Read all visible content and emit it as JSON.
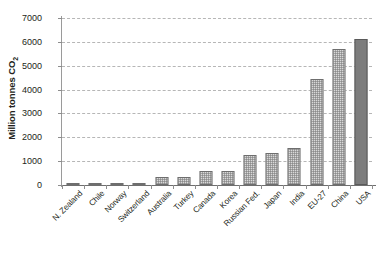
{
  "chart_data": {
    "type": "bar",
    "title": "",
    "subtitle": "",
    "xlabel": "",
    "ylabel": "Million tonnes CO2",
    "ylabel_display": "Million tonnes CO",
    "ylabel_subscript": "2",
    "ylim": [
      0,
      7000
    ],
    "grid": true,
    "grid_axis": "y",
    "legend": false,
    "legend_position": "none",
    "y_ticks": [
      0,
      1000,
      2000,
      3000,
      4000,
      5000,
      6000,
      7000
    ],
    "y_tick_labels": [
      "0",
      "1000",
      "2000",
      "3000",
      "4000",
      "5000",
      "6000",
      "7000"
    ],
    "categories": [
      "N. Zealand",
      "Chile",
      "Norway",
      "Switzerland",
      "Australia",
      "Turkey",
      "Canada",
      "Korea",
      "Russian Fed.",
      "Japan",
      "India",
      "EU-27",
      "China",
      "USA"
    ],
    "values": [
      35,
      60,
      75,
      85,
      330,
      340,
      580,
      590,
      1250,
      1350,
      1550,
      4450,
      5700,
      6100
    ],
    "bar_styles": [
      "checkered",
      "checkered",
      "checkered",
      "checkered",
      "checkered",
      "checkered",
      "checkered",
      "checkered",
      "checkered",
      "checkered",
      "checkered",
      "checkered",
      "checkered",
      "solid"
    ],
    "colors": {
      "bar_fill": "#d9d9d9",
      "bar_fill_highlight": "#7d7d7d",
      "bar_border": "#6e6e6e",
      "gridline": "#b6b6b6",
      "axis": "#6f6f6f",
      "text": "#231f20",
      "background": "#ffffff"
    }
  }
}
